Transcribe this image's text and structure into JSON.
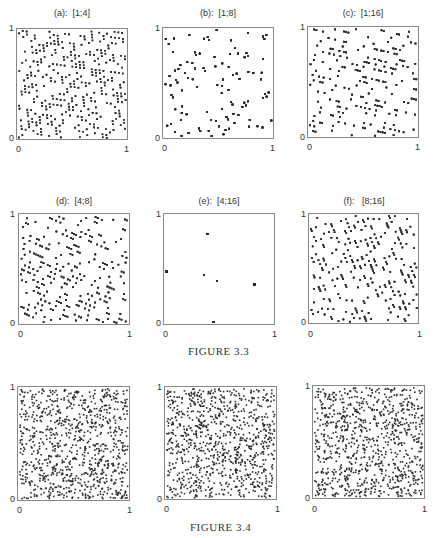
{
  "chart_data": [
    {
      "figure": "FIGURE 3.3",
      "type": "scatter",
      "x_range": [
        0,
        1
      ],
      "y_range": [
        0,
        1
      ],
      "grid": false,
      "panels": [
        {
          "id": "a",
          "title": "(a):  [1;4]",
          "pattern": "lattice",
          "params": [
            1,
            4
          ],
          "xticks": [
            "0",
            "1"
          ],
          "yticks": [
            "0",
            "1"
          ]
        },
        {
          "id": "b",
          "title": "(b):  [1;8]",
          "pattern": "lattice",
          "params": [
            1,
            8
          ],
          "xticks": [
            "0",
            "1"
          ],
          "yticks": [
            "0",
            "1"
          ]
        },
        {
          "id": "c",
          "title": "(c):  [1;16]",
          "pattern": "lattice",
          "params": [
            1,
            16
          ],
          "xticks": [
            "0",
            "1"
          ],
          "yticks": [
            "0",
            "1"
          ]
        },
        {
          "id": "d",
          "title": "(d):  [4;8]",
          "pattern": "lattice",
          "params": [
            4,
            8
          ],
          "xticks": [
            "0",
            "1"
          ],
          "yticks": [
            "0",
            "1"
          ]
        },
        {
          "id": "e",
          "title": "(e):  [4;16]",
          "pattern": "lattice",
          "params": [
            4,
            16
          ],
          "xticks": [
            "0",
            "1"
          ],
          "yticks": [
            "0",
            "1"
          ]
        },
        {
          "id": "f",
          "title": "(f):   [8;16]",
          "pattern": "lattice",
          "params": [
            8,
            16
          ],
          "xticks": [
            "0",
            "1"
          ],
          "yticks": [
            "0",
            "1"
          ]
        }
      ]
    },
    {
      "figure": "FIGURE 3.4",
      "type": "scatter",
      "x_range": [
        0,
        1
      ],
      "y_range": [
        0,
        1
      ],
      "grid": false,
      "panels": [
        {
          "id": "g",
          "title": "",
          "pattern": "random",
          "xticks": [
            "0",
            "1"
          ],
          "yticks": [
            "0",
            "1"
          ]
        },
        {
          "id": "h",
          "title": "",
          "pattern": "random",
          "xticks": [
            "0",
            "1"
          ],
          "yticks": [
            "0",
            "1"
          ]
        },
        {
          "id": "i",
          "title": "",
          "pattern": "random",
          "xticks": [
            "0",
            "1"
          ],
          "yticks": [
            "0",
            "1"
          ]
        }
      ]
    }
  ],
  "captions": {
    "fig33": "FIGURE 3.3",
    "fig34": "FIGURE 3.4"
  },
  "colors": {
    "dot": "#2a2a2a",
    "frame": "#888888"
  }
}
